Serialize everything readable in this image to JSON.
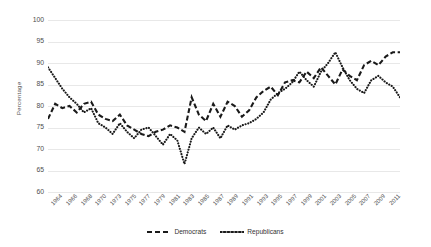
{
  "chart_data": {
    "type": "line",
    "title": "",
    "xlabel": "",
    "ylabel": "Percentage",
    "ylim": [
      60,
      100
    ],
    "ytick_values": [
      100,
      95,
      90,
      85,
      80,
      75,
      70,
      65,
      60
    ],
    "grid": true,
    "legend_position": "bottom",
    "x": [
      1963,
      1964,
      1965,
      1966,
      1967,
      1968,
      1969,
      1970,
      1971,
      1972,
      1973,
      1974,
      1975,
      1976,
      1977,
      1978,
      1979,
      1980,
      1981,
      1982,
      1983,
      1984,
      1985,
      1986,
      1987,
      1988,
      1989,
      1990,
      1991,
      1992,
      1993,
      1994,
      1995,
      1996,
      1997,
      1998,
      1999,
      2000,
      2001,
      2002,
      2003,
      2004,
      2005,
      2006,
      2007,
      2008,
      2009,
      2010,
      2011,
      2012
    ],
    "xtick_labels": [
      "1964",
      "1966",
      "1968",
      "1970",
      "1973",
      "1975",
      "1977",
      "1979",
      "1981",
      "1983",
      "1985",
      "1987",
      "1989",
      "1991",
      "1993",
      "1995",
      "1997",
      "1999",
      "2001",
      "2003",
      "2005",
      "2007",
      "2009",
      "2011"
    ],
    "series": [
      {
        "name": "Democrats",
        "style": "dashed",
        "color": "#1a1a1a",
        "values": [
          77.0,
          80.5,
          79.5,
          80.0,
          78.5,
          80.5,
          81.0,
          78.0,
          77.0,
          76.5,
          78.0,
          75.5,
          74.5,
          73.5,
          73.0,
          74.0,
          74.5,
          75.5,
          75.0,
          74.0,
          82.0,
          78.0,
          76.5,
          80.5,
          77.5,
          81.0,
          80.0,
          77.5,
          79.0,
          82.0,
          83.5,
          84.5,
          82.5,
          85.5,
          86.0,
          85.5,
          88.0,
          86.5,
          89.0,
          87.0,
          85.0,
          88.5,
          87.0,
          86.0,
          89.5,
          90.5,
          89.5,
          91.5,
          92.5,
          92.5
        ]
      },
      {
        "name": "Republicans",
        "style": "dotted",
        "color": "#1a1a1a",
        "values": [
          89.0,
          86.5,
          84.0,
          82.0,
          80.5,
          78.5,
          79.5,
          76.0,
          75.0,
          73.5,
          76.0,
          74.0,
          72.5,
          74.5,
          75.0,
          73.0,
          71.0,
          73.5,
          72.0,
          66.5,
          72.5,
          75.0,
          73.5,
          75.0,
          72.5,
          75.5,
          74.5,
          75.5,
          76.0,
          77.0,
          78.5,
          81.5,
          83.0,
          84.0,
          85.5,
          88.0,
          86.0,
          84.5,
          88.0,
          90.0,
          92.5,
          89.0,
          86.0,
          84.0,
          83.0,
          86.0,
          87.0,
          85.5,
          84.5,
          82.0
        ]
      }
    ]
  },
  "legend": {
    "items": [
      {
        "label": "Democrats"
      },
      {
        "label": "Republicans"
      }
    ]
  }
}
